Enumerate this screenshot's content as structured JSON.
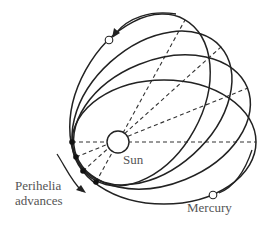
{
  "diagram": {
    "labels": {
      "sun": "Sun",
      "perihelia_line1": "Perihelia",
      "perihelia_line2": "advances",
      "mercury": "Mercury"
    },
    "sun": {
      "cx": 118,
      "cy": 142,
      "r": 11
    },
    "orbits": [
      {
        "angle": 0,
        "perihelion": [
          72,
          142
        ]
      },
      {
        "angle": -18,
        "perihelion": [
          76,
          157
        ]
      },
      {
        "angle": -36,
        "perihelion": [
          83,
          171
        ]
      },
      {
        "angle": -54,
        "perihelion": [
          96,
          182
        ]
      }
    ],
    "colors": {
      "stroke": "#222222",
      "text": "#555555",
      "background": "#ffffff"
    }
  }
}
